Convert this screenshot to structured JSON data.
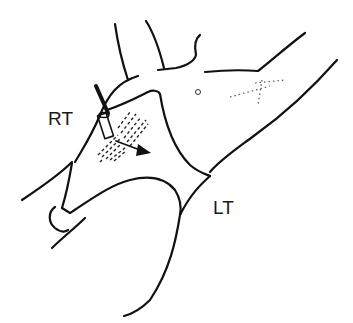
{
  "figure": {
    "type": "anatomical line drawing",
    "labels": {
      "right": "RT",
      "left": "LT"
    },
    "elements": [
      "needle-icon",
      "arrow-icon",
      "hatched-region",
      "umbilicus",
      "body-outline"
    ],
    "colors": {
      "line": "#111111",
      "background": "#ffffff"
    }
  }
}
